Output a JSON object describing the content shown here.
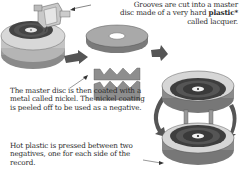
{
  "diagram": {
    "steps": [
      {
        "id": "cutting",
        "text_prefix": "Grooves are cut into a master disc made of a very hard ",
        "emphasis": "plastic*",
        "text_suffix": " called lacquer."
      },
      {
        "id": "coating",
        "text": "The master disc is then coated with a metal called nickel. The nickel coating is peeled off to be used as a negative."
      },
      {
        "id": "pressing",
        "text": "Hot plastic is pressed between two negatives, one for each side of the record."
      }
    ],
    "illustrations": [
      {
        "name": "cutting-lathe",
        "label": "lathe with cutting head"
      },
      {
        "name": "lacquer-master-disc",
        "label": "master disc"
      },
      {
        "name": "nickel-negative-cross-section",
        "label": "nickel coating cross-section"
      },
      {
        "name": "record-press",
        "label": "two negatives pressing record"
      }
    ],
    "colors": {
      "disc_gray": "#a8a8a8",
      "dark_gray": "#5a5a5a",
      "arrow_gray": "#555555",
      "text": "#2a2a2a"
    }
  }
}
